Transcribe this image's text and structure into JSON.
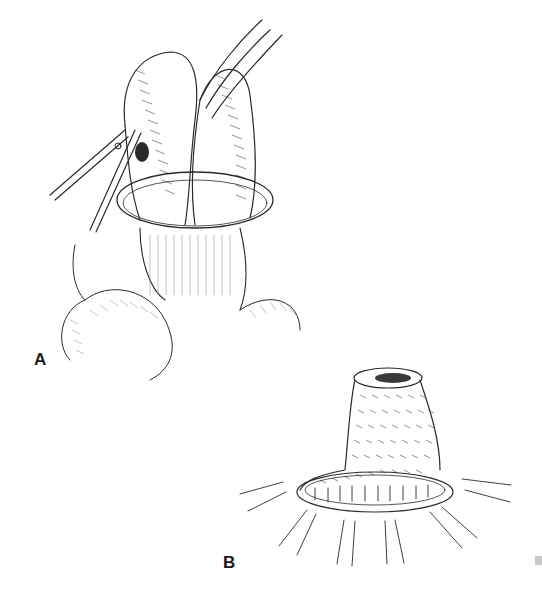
{
  "figure": {
    "panels": [
      {
        "id": "A",
        "label": "A",
        "description": "Surgical illustration: bowel loops held by instruments with a ring around the base"
      },
      {
        "id": "B",
        "label": "B",
        "description": "Surgical illustration: everted bowel stoma sutured to surrounding skin with radiating lines"
      }
    ]
  },
  "colors": {
    "background": "#ffffff",
    "ink": "#2a2a2a",
    "corner_mark": "#c8c8c8"
  }
}
